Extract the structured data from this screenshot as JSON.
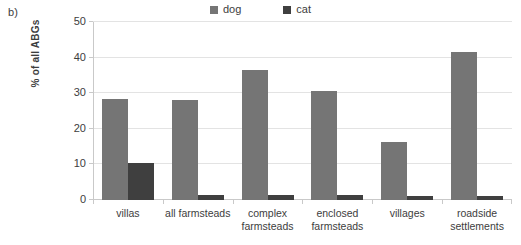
{
  "panel": {
    "label": "b)"
  },
  "legend": {
    "position": "top-center",
    "entries": [
      {
        "label": "dog",
        "color": "#757575",
        "swatch_name": "legend-swatch-dog"
      },
      {
        "label": "cat",
        "color": "#3f3f3f",
        "swatch_name": "legend-swatch-cat"
      }
    ]
  },
  "axes": {
    "y_title": "% of all ABGs",
    "y_ticks": [
      "0",
      "10",
      "20",
      "30",
      "40",
      "50"
    ]
  },
  "chart_data": {
    "type": "bar",
    "title": "",
    "subtitle": "",
    "xlabel": "",
    "ylabel": "% of all ABGs",
    "ylim": [
      0,
      50
    ],
    "yticks": [
      0,
      10,
      20,
      30,
      40,
      50
    ],
    "grid": true,
    "legend_position": "top-center",
    "categories": [
      "villas",
      "all farmsteads",
      "complex farmsteads",
      "enclosed farmsteads",
      "villages",
      "roadside settlements"
    ],
    "series": [
      {
        "name": "dog",
        "color": "#757575",
        "values": [
          28.4,
          28.0,
          36.4,
          30.7,
          16.3,
          41.6
        ]
      },
      {
        "name": "cat",
        "color": "#3f3f3f",
        "values": [
          10.4,
          1.5,
          1.4,
          1.3,
          1.2,
          1.2
        ]
      }
    ]
  }
}
